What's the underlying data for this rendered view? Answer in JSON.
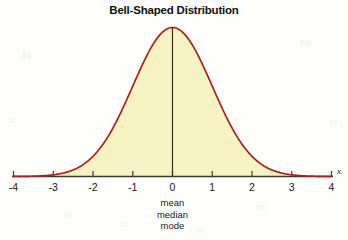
{
  "chart_data": {
    "type": "area",
    "title": "Bell-Shaped Distribution",
    "xlabel": "x",
    "ylabel": "",
    "xlim": [
      -4,
      4
    ],
    "ylim": [
      0,
      1
    ],
    "grid": false,
    "legend": null,
    "distribution": "normal",
    "mean": 0,
    "stddev": 1,
    "x_tick_labels": [
      "-4",
      "-3",
      "-2",
      "-1",
      "0",
      "1",
      "2",
      "3",
      "4"
    ],
    "x_ticks": [
      -4,
      -3,
      -2,
      -1,
      0,
      1,
      2,
      3,
      4
    ],
    "x": [
      -4,
      -3.75,
      -3.5,
      -3.25,
      -3,
      -2.75,
      -2.5,
      -2.25,
      -2,
      -1.75,
      -1.5,
      -1.25,
      -1,
      -0.75,
      -0.5,
      -0.25,
      0,
      0.25,
      0.5,
      0.75,
      1,
      1.25,
      1.5,
      1.75,
      2,
      2.25,
      2.5,
      2.75,
      3,
      3.25,
      3.5,
      3.75,
      4
    ],
    "values": [
      0.0003,
      0.0009,
      0.0022,
      0.0051,
      0.0111,
      0.0228,
      0.0439,
      0.0796,
      0.1353,
      0.2163,
      0.3247,
      0.4578,
      0.6065,
      0.7548,
      0.8825,
      0.9692,
      1.0,
      0.9692,
      0.8825,
      0.7548,
      0.6065,
      0.4578,
      0.3247,
      0.2163,
      0.1353,
      0.0796,
      0.0439,
      0.0228,
      0.0111,
      0.0051,
      0.0022,
      0.0009,
      0.0003
    ],
    "center_line_value": 0,
    "annotations": [
      "mean",
      "median",
      "mode"
    ],
    "colors": {
      "curve": "#A3241B",
      "fill": "#F7F2C4",
      "axis": "#3a3a33",
      "center_line": "#32301c",
      "text": "#1a1a1a",
      "background": "#fdfdfb"
    }
  },
  "figure": {
    "title": "Bell-Shaped Distribution",
    "axis_variable": "x",
    "annotation_mean": "mean",
    "annotation_median": "median",
    "annotation_mode": "mode"
  }
}
